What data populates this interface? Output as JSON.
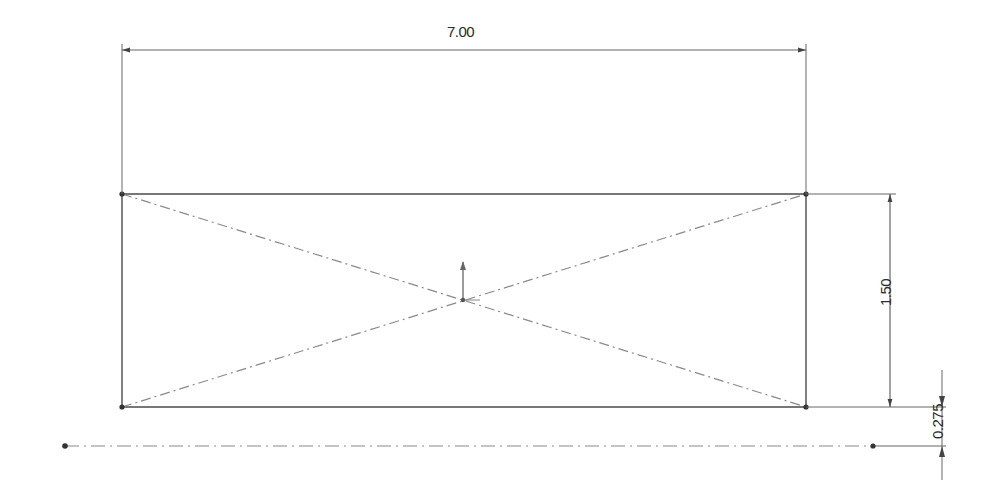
{
  "drawing": {
    "type": "sketch",
    "colors": {
      "geometry": "#4a4a4a",
      "construction": "#8a8a8a",
      "dimension": "#555555",
      "background": "#ffffff"
    },
    "rectangle": {
      "corners": [
        [
          122,
          194
        ],
        [
          806,
          194
        ],
        [
          806,
          407
        ],
        [
          122,
          407
        ]
      ]
    },
    "centerline": {
      "y": 446,
      "x_start": 65,
      "x_end": 875
    },
    "origin": {
      "x": 463,
      "y": 300
    }
  },
  "dimensions": {
    "width": {
      "label": "7.00",
      "value": 7.0
    },
    "height": {
      "label": "1.50",
      "value": 1.5
    },
    "offset": {
      "label": "0.275",
      "value": 0.275
    }
  }
}
